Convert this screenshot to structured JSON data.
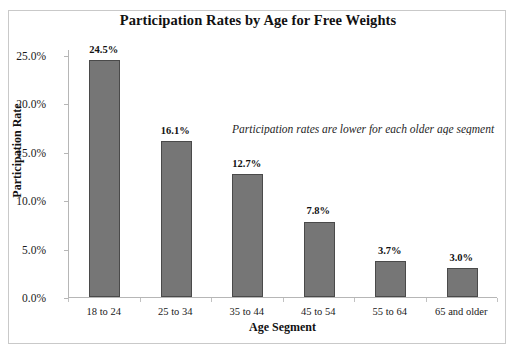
{
  "chart_data": {
    "type": "bar",
    "title": "Participation Rates by Age for Free Weights",
    "xlabel": "Age Segment",
    "ylabel": "Participation Rate",
    "categories": [
      "18 to 24",
      "25 to 34",
      "35 to 44",
      "45 to 54",
      "55 to 64",
      "65 and older"
    ],
    "values": [
      24.5,
      16.1,
      12.7,
      7.8,
      3.7,
      3.0
    ],
    "value_labels": [
      "24.5%",
      "16.1%",
      "12.7%",
      "7.8%",
      "3.7%",
      "3.0%"
    ],
    "ylim": [
      0,
      25
    ],
    "ytick_values": [
      0,
      5,
      10,
      15,
      20,
      25
    ],
    "ytick_labels": [
      "0.0%",
      "5.0%",
      "10.0%",
      "15.0%",
      "20.0%",
      "25.0%"
    ],
    "grid": false,
    "legend": "none",
    "bar_color": "#767676",
    "bar_border_color": "#4a4a4a",
    "annotations": [
      {
        "text": "Participation rates are lower for each older age segment",
        "style": "italic"
      }
    ]
  }
}
